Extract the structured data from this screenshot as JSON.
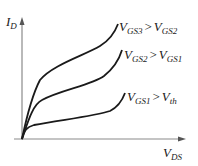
{
  "diagram": {
    "axes": {
      "y_label": {
        "main": "I",
        "sub": "D"
      },
      "x_label": {
        "main": "V",
        "sub": "DS"
      }
    },
    "curves": [
      {
        "id": "vgs3",
        "label": {
          "lhs_main": "V",
          "lhs_sub": "GS3",
          "op": ">",
          "rhs_main": "V",
          "rhs_sub": "GS2"
        }
      },
      {
        "id": "vgs2",
        "label": {
          "lhs_main": "V",
          "lhs_sub": "GS2",
          "op": ">",
          "rhs_main": "V",
          "rhs_sub": "GS1"
        }
      },
      {
        "id": "vgs1",
        "label": {
          "lhs_main": "V",
          "lhs_sub": "GS1",
          "op": ">",
          "rhs_main": "V",
          "rhs_sub": "th"
        }
      }
    ],
    "colors": {
      "curve": "#1a1a1a",
      "axis": "#8a8a8a"
    }
  }
}
